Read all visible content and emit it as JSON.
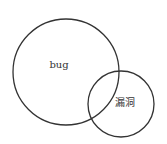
{
  "diagram": {
    "type": "venn",
    "sets": [
      {
        "label": "bug",
        "cx": 66,
        "cy": 72,
        "r": 53
      },
      {
        "label": "漏洞",
        "cx": 121,
        "cy": 104,
        "r": 33
      }
    ],
    "stroke_color": "#333333",
    "background": "#ffffff"
  }
}
